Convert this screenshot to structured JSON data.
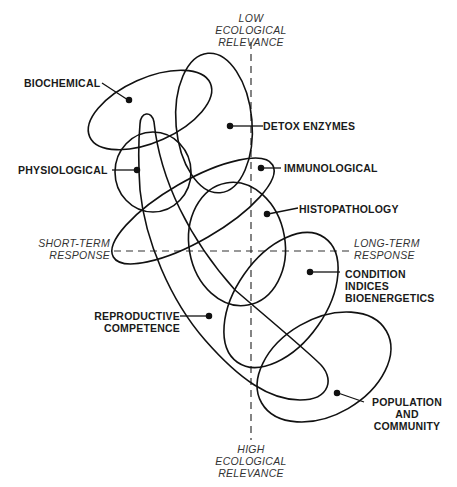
{
  "axes": {
    "top": [
      "LOW",
      "ECOLOGICAL",
      "RELEVANCE"
    ],
    "bottom": [
      "HIGH",
      "ECOLOGICAL",
      "RELEVANCE"
    ],
    "left": [
      "SHORT-TERM",
      "RESPONSE"
    ],
    "right": [
      "LONG-TERM",
      "RESPONSE"
    ]
  },
  "regions": {
    "biochemical": [
      "BIOCHEMICAL"
    ],
    "detox": [
      "DETOX ENZYMES"
    ],
    "physiological": [
      "PHYSIOLOGICAL"
    ],
    "immunological": [
      "IMMUNOLOGICAL"
    ],
    "histopathology": [
      "HISTOPATHOLOGY"
    ],
    "condition": [
      "CONDITION",
      "INDICES",
      "BIOENERGETICS"
    ],
    "reproductive": [
      "REPRODUCTIVE",
      "COMPETENCE"
    ],
    "population": [
      "POPULATION",
      "AND",
      "COMMUNITY"
    ]
  },
  "colors": {
    "line": "#111111",
    "dashed_axis": "#333333",
    "background": "#ffffff"
  }
}
